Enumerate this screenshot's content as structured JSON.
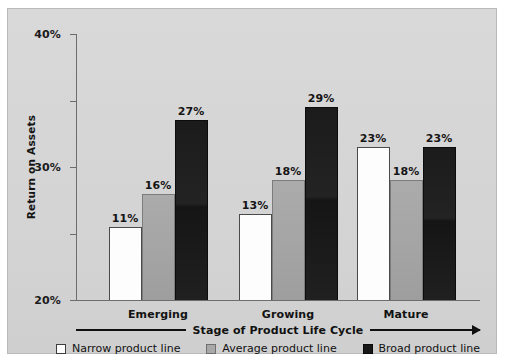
{
  "chart_data": {
    "type": "bar",
    "title": "",
    "subtitle": "",
    "xlabel": "Stage of Product Life Cycle",
    "ylabel": "Return on Assets",
    "categories": [
      "Emerging",
      "Growing",
      "Mature"
    ],
    "series": [
      {
        "name": "Narrow product line",
        "color": "#fdfdfd",
        "values": [
          11,
          13,
          23
        ],
        "labels": [
          "11%",
          "13%",
          "23%"
        ]
      },
      {
        "name": "Average product line",
        "color": "#a8a8a8",
        "values": [
          16,
          18,
          18
        ],
        "labels": [
          "16%",
          "18%",
          "18%"
        ]
      },
      {
        "name": "Broad product line",
        "color": "#181818",
        "values": [
          27,
          29,
          23
        ],
        "labels": [
          "27%",
          "29%",
          "23%"
        ]
      }
    ],
    "ylim": [
      0,
      40
    ],
    "yticks": [
      0,
      10,
      20,
      30,
      40
    ],
    "ytick_labels": [
      "0",
      "10%",
      "20%",
      "30%",
      "40%"
    ],
    "grid": false,
    "legend_position": "bottom",
    "value_labels": true,
    "units": "percent",
    "xaxis_arrow": true
  },
  "figure": {
    "background_color": "#ffffff",
    "panel_color": "#d5d5d5",
    "border_color": "#b9b9b9",
    "axis_color": "#6d6d6d",
    "text_color": "#141414"
  },
  "legend": {
    "items": [
      {
        "label": "Narrow product line",
        "swatch": "narrow"
      },
      {
        "label": "Average product line",
        "swatch": "average"
      },
      {
        "label": "Broad product line",
        "swatch": "broad"
      }
    ]
  }
}
